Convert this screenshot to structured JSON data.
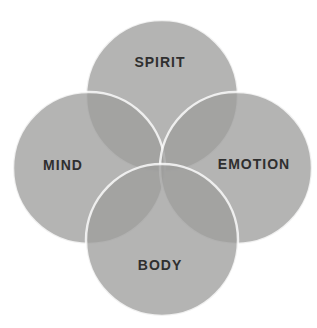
{
  "diagram": {
    "type": "venn-4-circle",
    "labels": {
      "top": "SPIRIT",
      "left": "MIND",
      "right": "EMOTION",
      "bottom": "BODY"
    },
    "colors": {
      "background": "#ffffff",
      "circle_fill": "#9e9e9c",
      "circle_stroke": "#ffffff",
      "label_text": "#2f2f2f",
      "single_region_appearance": "#b4b4b2",
      "double_overlap_appearance": "#a3a3a1",
      "center_overlap_appearance": "#969694"
    }
  }
}
